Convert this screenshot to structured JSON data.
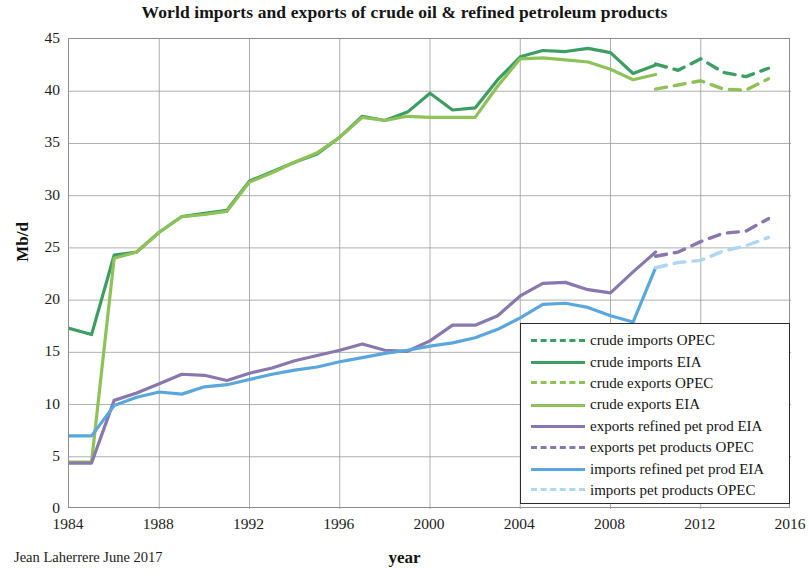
{
  "chart_data": {
    "type": "line",
    "title": "World imports and exports of crude oil & refined petroleum products",
    "xlabel": "year",
    "ylabel": "Mb/d",
    "xlim": [
      1984,
      2016
    ],
    "ylim": [
      0,
      45
    ],
    "xticks": [
      1984,
      1988,
      1992,
      1996,
      2000,
      2004,
      2008,
      2012,
      2016
    ],
    "yticks": [
      0,
      5,
      10,
      15,
      20,
      25,
      30,
      35,
      40,
      45
    ],
    "grid": true,
    "legend_position": "lower right",
    "credit": "Jean Laherrere June 2017",
    "series": [
      {
        "name": "crude imports OPEC",
        "color": "#3d9e63",
        "style": "dashed",
        "x": [
          2010,
          2011,
          2012,
          2013,
          2014,
          2015
        ],
        "values": [
          42.6,
          42.0,
          43.1,
          41.8,
          41.4,
          42.2
        ]
      },
      {
        "name": "crude imports EIA",
        "color": "#3d9e63",
        "style": "solid",
        "x": [
          1984,
          1985,
          1986,
          1987,
          1988,
          1989,
          1990,
          1991,
          1992,
          1993,
          1994,
          1995,
          1996,
          1997,
          1998,
          1999,
          2000,
          2001,
          2002,
          2003,
          2004,
          2005,
          2006,
          2007,
          2008,
          2009,
          2010
        ],
        "values": [
          17.3,
          16.7,
          24.3,
          24.6,
          26.5,
          28.0,
          28.3,
          28.6,
          31.4,
          32.3,
          33.2,
          34.0,
          35.6,
          37.6,
          37.2,
          38.0,
          39.8,
          38.2,
          38.4,
          41.1,
          43.3,
          43.9,
          43.8,
          44.1,
          43.7,
          41.7,
          42.5
        ]
      },
      {
        "name": "crude exports OPEC",
        "color": "#8fc159",
        "style": "dashed",
        "x": [
          2010,
          2011,
          2012,
          2013,
          2014,
          2015
        ],
        "values": [
          40.2,
          40.6,
          41.0,
          40.2,
          40.1,
          41.2
        ]
      },
      {
        "name": "crude exports EIA",
        "color": "#8fc159",
        "style": "solid",
        "x": [
          1984,
          1985,
          1986,
          1987,
          1988,
          1989,
          1990,
          1991,
          1992,
          1993,
          1994,
          1995,
          1996,
          1997,
          1998,
          1999,
          2000,
          2001,
          2002,
          2003,
          2004,
          2005,
          2006,
          2007,
          2008,
          2009,
          2010
        ],
        "values": [
          4.5,
          4.5,
          24.0,
          24.6,
          26.5,
          28.0,
          28.2,
          28.5,
          31.3,
          32.2,
          33.2,
          34.1,
          35.6,
          37.5,
          37.2,
          37.6,
          37.5,
          37.5,
          37.5,
          40.5,
          43.1,
          43.2,
          43.0,
          42.8,
          42.1,
          41.1,
          41.6
        ]
      },
      {
        "name": "exports refined pet prod EIA",
        "color": "#8a77ad",
        "style": "solid",
        "x": [
          1984,
          1985,
          1986,
          1987,
          1988,
          1989,
          1990,
          1991,
          1992,
          1993,
          1994,
          1995,
          1996,
          1997,
          1998,
          1999,
          2000,
          2001,
          2002,
          2003,
          2004,
          2005,
          2006,
          2007,
          2008,
          2009,
          2010
        ],
        "values": [
          4.4,
          4.4,
          10.4,
          11.1,
          12.0,
          12.9,
          12.8,
          12.3,
          13.0,
          13.5,
          14.2,
          14.7,
          15.2,
          15.8,
          15.2,
          15.1,
          16.1,
          17.6,
          17.6,
          18.5,
          20.4,
          21.6,
          21.7,
          21.0,
          20.7,
          22.7,
          24.6
        ]
      },
      {
        "name": "exports pet products OPEC",
        "color": "#8a77ad",
        "style": "dashed",
        "x": [
          2010,
          2011,
          2012,
          2013,
          2014,
          2015
        ],
        "values": [
          24.2,
          24.6,
          25.6,
          26.4,
          26.6,
          27.8
        ]
      },
      {
        "name": "imports refined pet prod EIA",
        "color": "#5aa7de",
        "style": "solid",
        "x": [
          1984,
          1985,
          1986,
          1987,
          1988,
          1989,
          1990,
          1991,
          1992,
          1993,
          1994,
          1995,
          1996,
          1997,
          1998,
          1999,
          2000,
          2001,
          2002,
          2003,
          2004,
          2005,
          2006,
          2007,
          2008,
          2009,
          2010
        ],
        "values": [
          7.0,
          7.0,
          9.9,
          10.7,
          11.2,
          11.0,
          11.7,
          11.9,
          12.4,
          12.9,
          13.3,
          13.6,
          14.1,
          14.5,
          14.9,
          15.2,
          15.6,
          15.9,
          16.4,
          17.2,
          18.3,
          19.6,
          19.7,
          19.3,
          18.5,
          17.9,
          23.1
        ]
      },
      {
        "name": "imports pet products OPEC",
        "color": "#aed7f0",
        "style": "dashed",
        "x": [
          2010,
          2011,
          2012,
          2013,
          2014,
          2015
        ],
        "values": [
          23.1,
          23.6,
          23.8,
          24.7,
          25.2,
          26.0
        ]
      }
    ]
  },
  "legend": {
    "items": [
      {
        "label": "crude imports OPEC",
        "color": "#3d9e63",
        "style": "dashed"
      },
      {
        "label": "crude imports EIA",
        "color": "#3d9e63",
        "style": "solid"
      },
      {
        "label": "crude exports OPEC",
        "color": "#8fc159",
        "style": "dashed"
      },
      {
        "label": "crude exports EIA",
        "color": "#8fc159",
        "style": "solid"
      },
      {
        "label": "exports refined pet prod EIA",
        "color": "#8a77ad",
        "style": "solid"
      },
      {
        "label": "exports pet products OPEC",
        "color": "#8a77ad",
        "style": "dashed"
      },
      {
        "label": "imports refined pet prod EIA",
        "color": "#5aa7de",
        "style": "solid"
      },
      {
        "label": "imports pet products OPEC",
        "color": "#aed7f0",
        "style": "dashed"
      }
    ]
  }
}
